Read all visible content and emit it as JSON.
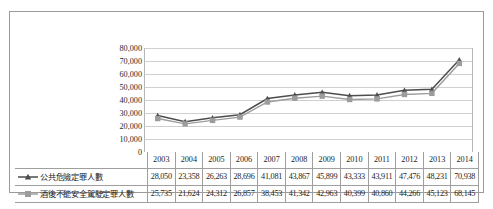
{
  "chart_data": {
    "type": "line",
    "title": "",
    "subtitle": "",
    "xlabel": "",
    "ylabel": "",
    "grid": true,
    "legend_position": "data-table-left",
    "ylim": [
      0,
      80000
    ],
    "ytick_labels": [
      "80,000",
      "70,000",
      "60,000",
      "50,000",
      "40,000",
      "30,000",
      "20,000",
      "10,000",
      "0"
    ],
    "yticks": [
      80000,
      70000,
      60000,
      50000,
      40000,
      30000,
      20000,
      10000,
      0
    ],
    "categories": [
      "2003",
      "2004",
      "2005",
      "2006",
      "2007",
      "2008",
      "2009",
      "2010",
      "2011",
      "2012",
      "2013",
      "2014"
    ],
    "series": [
      {
        "name": "公共危險定罪人數",
        "marker": "triangle",
        "color": "#4d4d4d",
        "values": [
          28050,
          23358,
          26263,
          28696,
          41081,
          43867,
          45899,
          43333,
          43911,
          47476,
          48231,
          70938
        ],
        "labels": [
          "28,050",
          "23,358",
          "26,263",
          "28,696",
          "41,081",
          "43,867",
          "45,899",
          "43,333",
          "43,911",
          "47,476",
          "48,231",
          "70,938"
        ]
      },
      {
        "name": "酒後不能安全駕駛定罪人數",
        "marker": "square",
        "color": "#9c9c9c",
        "values": [
          25735,
          21624,
          24312,
          26857,
          38453,
          41342,
          42963,
          40399,
          40860,
          44266,
          45123,
          68145
        ],
        "labels": [
          "25,735",
          "21,624",
          "24,312",
          "26,857",
          "38,453",
          "41,342",
          "42,963",
          "40,399",
          "40,860",
          "44,266",
          "45,123",
          "68,145"
        ]
      }
    ]
  },
  "colors": {
    "series1": "#4d4d4d",
    "series2": "#9c9c9c",
    "gridline": "#c3c3c3",
    "border": "#9a9a9a",
    "text": "#1d1d1d"
  }
}
